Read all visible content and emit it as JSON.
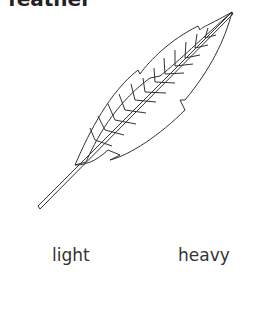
{
  "title": "feather",
  "image": {
    "icon": "feather-icon",
    "stroke_color": "#333333"
  },
  "labels": {
    "left": "light",
    "right": "heavy"
  }
}
